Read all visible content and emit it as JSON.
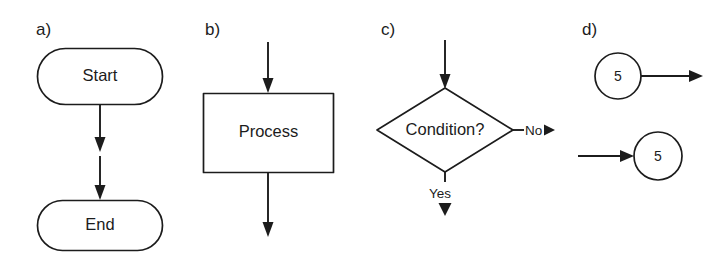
{
  "figure": {
    "background_color": "#ffffff",
    "line_color": "#1c1c1c"
  },
  "panels": [
    {
      "key": "a",
      "label": "a)",
      "description": "terminator symbols connected by flow arrows",
      "nodes": [
        {
          "name": "start-terminator",
          "shape": "stadium",
          "text": "Start"
        },
        {
          "name": "end-terminator",
          "shape": "stadium",
          "text": "End"
        }
      ],
      "arrows": [
        {
          "name": "start-to-middle-arrow",
          "direction": "down"
        },
        {
          "name": "middle-to-end-arrow",
          "direction": "down"
        }
      ]
    },
    {
      "key": "b",
      "label": "b)",
      "description": "process symbol with inbound and outbound flow arrows",
      "nodes": [
        {
          "name": "process-box",
          "shape": "rectangle",
          "text": "Process"
        }
      ],
      "arrows": [
        {
          "name": "process-inbound-arrow",
          "direction": "down"
        },
        {
          "name": "process-outbound-arrow",
          "direction": "down"
        }
      ]
    },
    {
      "key": "c",
      "label": "c)",
      "description": "decision symbol with yes and no branches",
      "nodes": [
        {
          "name": "decision-diamond",
          "shape": "diamond",
          "text": "Condition?"
        }
      ],
      "branches": [
        {
          "name": "branch-no",
          "text": "No",
          "direction": "right"
        },
        {
          "name": "branch-yes",
          "text": "Yes",
          "direction": "down"
        }
      ],
      "arrows": [
        {
          "name": "decision-inbound-arrow",
          "direction": "down"
        }
      ]
    },
    {
      "key": "d",
      "label": "d)",
      "description": "on-page connector symbols",
      "nodes": [
        {
          "name": "connector-out",
          "shape": "circle",
          "text": "5"
        },
        {
          "name": "connector-in",
          "shape": "circle",
          "text": "5"
        }
      ],
      "arrows": [
        {
          "name": "connector-out-arrow",
          "direction": "right"
        },
        {
          "name": "connector-in-arrow",
          "direction": "right"
        }
      ]
    }
  ]
}
